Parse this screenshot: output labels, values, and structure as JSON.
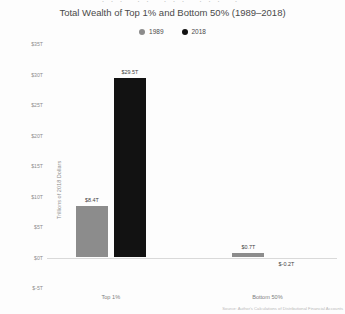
{
  "figure": {
    "title": "Total Wealth of Top 1% and Bottom 50% (1989–2018)",
    "top_clip_text": "··· ·· ··· ··· ·",
    "source_note": "Source: Author's Calculations of Distributional Financial Accounts"
  },
  "legend": {
    "items": [
      {
        "label": "1989",
        "color": "#8c8c8c",
        "icon": "legend-dot-icon"
      },
      {
        "label": "2018",
        "color": "#121212",
        "icon": "legend-dot-icon"
      }
    ]
  },
  "chart_data": {
    "type": "bar",
    "title": "Total Wealth of Top 1% and Bottom 50% (1989–2018)",
    "xlabel": "",
    "ylabel": "Trillions of 2018 Dollars",
    "categories": [
      "Top 1%",
      "Bottom 50%"
    ],
    "series": [
      {
        "name": "1989",
        "color": "#8c8c8c",
        "values": [
          8.4,
          0.7
        ],
        "labels": [
          "$8.4T",
          "$0.7T"
        ]
      },
      {
        "name": "2018",
        "color": "#121212",
        "values": [
          29.5,
          -0.2
        ],
        "labels": [
          "$29.5T",
          "$-0.2T"
        ]
      }
    ],
    "ylim": [
      -5,
      35
    ],
    "ytick_values": [
      35,
      30,
      25,
      20,
      15,
      10,
      5,
      0,
      -5
    ],
    "ytick_labels": [
      "$35T",
      "$30T",
      "$25T",
      "$20T",
      "$15T",
      "$10T",
      "$5T",
      "$0T",
      "$-5T"
    ],
    "grid": false,
    "legend_position": "top-center"
  }
}
